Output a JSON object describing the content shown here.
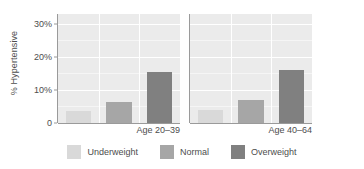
{
  "chart_data": {
    "type": "bar",
    "title": "",
    "xlabel": "",
    "ylabel": "% Hypertensive",
    "ylim": [
      0,
      33
    ],
    "grid": true,
    "legend_position": "bottom",
    "categories": [
      "Underweight",
      "Normal",
      "Overweight"
    ],
    "facets": [
      "Age 20–39",
      "Age 40–64"
    ],
    "yticks": [
      {
        "value": 0,
        "label": "0"
      },
      {
        "value": 10,
        "label": "10%"
      },
      {
        "value": 20,
        "label": "20%"
      },
      {
        "value": 30,
        "label": "30%"
      }
    ],
    "series": [
      {
        "name": "Age 20–39",
        "values": [
          3.5,
          6.5,
          15.3
        ]
      },
      {
        "name": "Age 40–64",
        "values": [
          3.8,
          7.0,
          16.2
        ]
      }
    ],
    "colors": {
      "Underweight": "#d9d9d9",
      "Normal": "#a6a6a6",
      "Overweight": "#808080",
      "panel_background": "#ebebeb",
      "gridline": "#ffffff",
      "axis": "#9a9a9a",
      "text": "#4d4d4d"
    }
  },
  "legend": {
    "items": [
      {
        "label": "Underweight",
        "color": "#d9d9d9"
      },
      {
        "label": "Normal",
        "color": "#a6a6a6"
      },
      {
        "label": "Overweight",
        "color": "#808080"
      }
    ]
  }
}
